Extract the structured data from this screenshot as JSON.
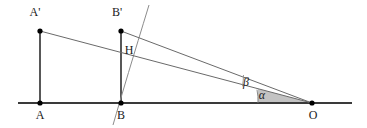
{
  "diagram": {
    "background_color": "#ffffff",
    "line_color": "#4d4d4d",
    "baseline_color": "#3a3a3a",
    "vertex_dot_color": "#000000",
    "shade_color": "#b5b5b5",
    "arc_color": "#7a7a7a",
    "labels": {
      "a_prime": "A'",
      "b_prime": "B'",
      "h": "H",
      "a": "A",
      "b": "B",
      "o": "O",
      "alpha": "α",
      "beta": "β"
    },
    "points": {
      "a_prime": {
        "x": 40,
        "y": 31
      },
      "b_prime": {
        "x": 121,
        "y": 31
      },
      "h": {
        "x": 121,
        "y": 47
      },
      "a": {
        "x": 40,
        "y": 103
      },
      "b": {
        "x": 121,
        "y": 103
      },
      "o": {
        "x": 312,
        "y": 103
      }
    },
    "label_positions": {
      "a_prime": {
        "x": 35,
        "y": 16
      },
      "b_prime": {
        "x": 117,
        "y": 16
      },
      "h": {
        "x": 129,
        "y": 54
      },
      "a": {
        "x": 40,
        "y": 119
      },
      "b": {
        "x": 121,
        "y": 119
      },
      "o": {
        "x": 313,
        "y": 119
      },
      "alpha": {
        "x": 262,
        "y": 99
      },
      "beta": {
        "x": 246,
        "y": 86
      }
    },
    "baseline": {
      "x1": 18,
      "y1": 103,
      "x2": 352,
      "y2": 103
    },
    "segments": [
      {
        "name": "segment-a-aprime",
        "x1": 40,
        "y1": 31,
        "x2": 40,
        "y2": 103
      },
      {
        "name": "segment-b-bprime",
        "x1": 121,
        "y1": 31,
        "x2": 121,
        "y2": 103
      },
      {
        "name": "ray-aprime-to-o",
        "x1": 40,
        "y1": 31,
        "x2": 312,
        "y2": 103
      },
      {
        "name": "ray-bprime-to-o",
        "x1": 121,
        "y1": 31,
        "x2": 312,
        "y2": 103
      }
    ],
    "arc_through_b": {
      "start_x": 113,
      "start_y": 124,
      "ctrl_x": 131,
      "ctrl_y": 52,
      "end_x": 149,
      "end_y": 5
    },
    "angle_marks": {
      "alpha_arc": {
        "cx": 312,
        "cy": 103,
        "radius": 54
      },
      "beta_arc": {
        "cx": 312,
        "cy": 103,
        "radius": 70
      }
    },
    "shaded_wedge": "Grey shaded angular wedge at vertex O between the baseline and the lower ray"
  }
}
